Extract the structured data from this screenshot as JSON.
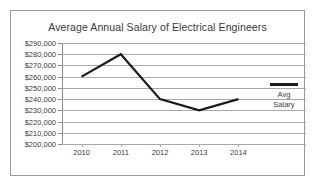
{
  "chart_data": {
    "type": "line",
    "title": "Average Annual Salary of Electrical Engineers",
    "xlabel": "",
    "ylabel": "",
    "categories": [
      "2010",
      "2011",
      "2012",
      "2013",
      "2014"
    ],
    "series": [
      {
        "name": "Avg Salary",
        "values": [
          260000,
          280000,
          240000,
          230000,
          240000
        ]
      }
    ],
    "ylim": [
      200000,
      290000
    ],
    "ytick_step": 10000,
    "ytick_labels": [
      "$290,000",
      "$280,000",
      "$270,000",
      "$260,000",
      "$250,000",
      "$240,000",
      "$230,000",
      "$220,000",
      "$210,000",
      "$200,000"
    ],
    "ytick_values": [
      290000,
      280000,
      270000,
      260000,
      250000,
      240000,
      230000,
      220000,
      210000,
      200000
    ],
    "grid": true,
    "legend_position": "right",
    "legend": [
      {
        "label_line1": "Avg",
        "label_line2": "Salary",
        "color": "#1a1a1a"
      }
    ],
    "colors": {
      "line": "#1a1a1a",
      "grid": "#a8a8a8",
      "axis": "#8c8c8c",
      "text": "#3a3a3a",
      "border": "#9a9a9a",
      "background": "#ffffff"
    }
  }
}
